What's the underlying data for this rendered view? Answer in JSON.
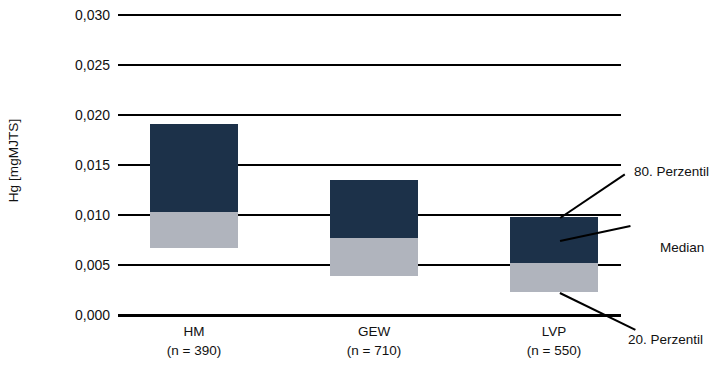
{
  "chart_data": {
    "type": "bar",
    "title": "",
    "subtitle": "",
    "xlabel": "",
    "ylabel": "Hg [mgMJTS]",
    "ylim": [
      0.0,
      0.03
    ],
    "ytick_values": [
      0.0,
      0.005,
      0.01,
      0.015,
      0.02,
      0.025,
      0.03
    ],
    "ytick_labels": [
      "0,000",
      "0,005",
      "0,010",
      "0,015",
      "0,020",
      "0,025",
      "0,030"
    ],
    "grid": true,
    "legend_position": "none",
    "categories": [
      "HM",
      "GEW",
      "LVP"
    ],
    "category_sublabels": [
      "(n = 390)",
      "(n = 710)",
      "(n = 550)"
    ],
    "sample_sizes": [
      390,
      710,
      550
    ],
    "series": [
      {
        "name": "20. Perzentil",
        "values": [
          0.0067,
          0.0039,
          0.0023
        ]
      },
      {
        "name": "Median",
        "values": [
          0.0103,
          0.0077,
          0.0052
        ]
      },
      {
        "name": "80. Perzentil",
        "values": [
          0.0191,
          0.0135,
          0.0098
        ]
      }
    ],
    "bars": [
      {
        "category": "HM",
        "p20": 0.0067,
        "median": 0.0103,
        "p80": 0.0191
      },
      {
        "category": "GEW",
        "p20": 0.0039,
        "median": 0.0077,
        "p80": 0.0135
      },
      {
        "category": "LVP",
        "p20": 0.0023,
        "median": 0.0052,
        "p80": 0.0098
      }
    ],
    "annotations": [
      "80. Perzentil",
      "Median",
      "20. Perzentil"
    ],
    "colors": {
      "upper_box": "#1c3149",
      "lower_box": "#b0b4bd",
      "gridline": "#000000",
      "text": "#111111",
      "background": "#ffffff"
    }
  },
  "axis": {
    "y_title": "Hg [mgMJTS]",
    "ticks": [
      {
        "label": "0,030",
        "value": 0.03
      },
      {
        "label": "0,025",
        "value": 0.025
      },
      {
        "label": "0,020",
        "value": 0.02
      },
      {
        "label": "0,015",
        "value": 0.015
      },
      {
        "label": "0,010",
        "value": 0.01
      },
      {
        "label": "0,005",
        "value": 0.005
      },
      {
        "label": "0,000",
        "value": 0.0
      }
    ]
  },
  "categories": [
    {
      "name": "HM",
      "n_label": "(n = 390)"
    },
    {
      "name": "GEW",
      "n_label": "(n = 710)"
    },
    {
      "name": "LVP",
      "n_label": "(n = 550)"
    }
  ],
  "annotations": {
    "p80": "80. Perzentil",
    "median": "Median",
    "p20": "20. Perzentil"
  }
}
